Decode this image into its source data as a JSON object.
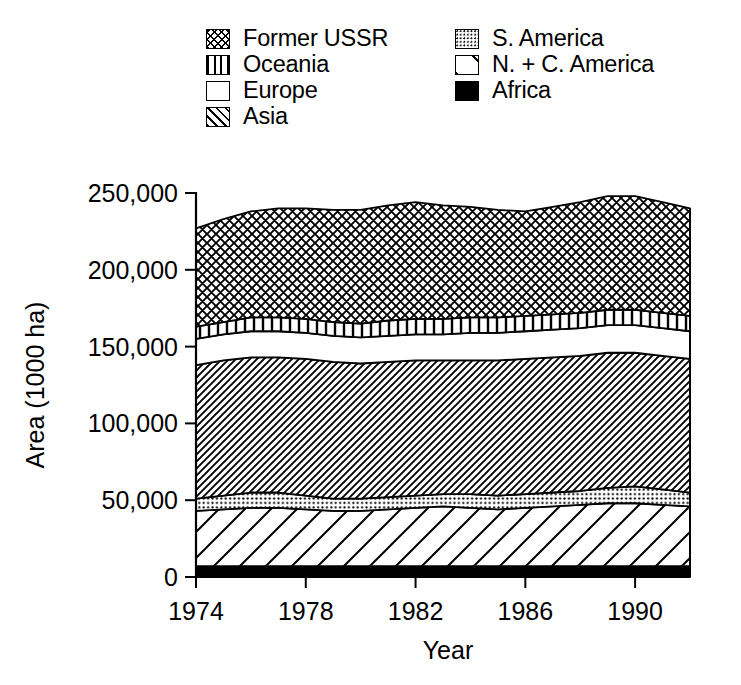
{
  "chart_data": {
    "type": "area",
    "stacked": true,
    "title": "",
    "xlabel": "Year",
    "ylabel": "Area (1000 ha)",
    "xlim": [
      1974,
      1992
    ],
    "ylim": [
      0,
      250000
    ],
    "ytick_labels": [
      "0",
      "50,000",
      "100,000",
      "150,000",
      "200,000",
      "250,000"
    ],
    "ytick_values": [
      0,
      50000,
      100000,
      150000,
      200000,
      250000
    ],
    "xtick_labels": [
      "1974",
      "1978",
      "1982",
      "1986",
      "1990"
    ],
    "xtick_values": [
      1974,
      1978,
      1982,
      1986,
      1990
    ],
    "grid": false,
    "legend_position": "above-plot",
    "x": [
      1974,
      1975,
      1976,
      1977,
      1978,
      1979,
      1980,
      1981,
      1982,
      1983,
      1984,
      1985,
      1986,
      1987,
      1988,
      1989,
      1990,
      1991,
      1992
    ],
    "stack_order_bottom_to_top": [
      "Africa",
      "N. + C. America",
      "S. America",
      "Asia",
      "Europe",
      "Oceania",
      "Former USSR"
    ],
    "series": [
      {
        "name": "Africa",
        "pattern": "solid-black",
        "values": [
          7000,
          7000,
          7000,
          7000,
          7000,
          7000,
          7000,
          7000,
          7000,
          7000,
          7000,
          7000,
          7000,
          7000,
          7000,
          7000,
          7000,
          7000,
          7000
        ]
      },
      {
        "name": "N. + C. America",
        "pattern": "diagonal-sparse",
        "values": [
          36000,
          37000,
          38000,
          38000,
          37000,
          36000,
          36000,
          37000,
          38000,
          39000,
          38000,
          37000,
          38000,
          39000,
          40000,
          41000,
          41000,
          40000,
          39000
        ]
      },
      {
        "name": "S. America",
        "pattern": "dots",
        "values": [
          8000,
          9000,
          10000,
          10000,
          9000,
          8000,
          8000,
          8000,
          8000,
          8000,
          9000,
          9000,
          9000,
          9000,
          9000,
          10000,
          11000,
          10000,
          9000
        ]
      },
      {
        "name": "Asia",
        "pattern": "diagonal-dense",
        "values": [
          87000,
          88000,
          88000,
          88000,
          89000,
          89000,
          88000,
          88000,
          88000,
          87000,
          87000,
          88000,
          88000,
          88000,
          88000,
          88000,
          87000,
          87000,
          87000
        ]
      },
      {
        "name": "Europe",
        "pattern": "white",
        "values": [
          17000,
          17000,
          17000,
          17000,
          17000,
          17000,
          17000,
          17000,
          17000,
          17000,
          18000,
          18000,
          18000,
          18000,
          18000,
          18000,
          18000,
          18000,
          18000
        ]
      },
      {
        "name": "Oceania",
        "pattern": "vertical-lines",
        "values": [
          8000,
          8000,
          9000,
          9000,
          9000,
          9000,
          9000,
          10000,
          10000,
          10000,
          10000,
          10000,
          10000,
          10000,
          10000,
          10000,
          10000,
          10000,
          10000
        ]
      },
      {
        "name": "Former USSR",
        "pattern": "cross-hatch",
        "values": [
          64000,
          67000,
          69000,
          71000,
          72000,
          73000,
          74000,
          75000,
          76000,
          74000,
          72000,
          70000,
          68000,
          70000,
          72000,
          74000,
          74000,
          72000,
          70000
        ]
      }
    ],
    "stack_tops": {
      "Africa": [
        7000,
        7000,
        7000,
        7000,
        7000,
        7000,
        7000,
        7000,
        7000,
        7000,
        7000,
        7000,
        7000,
        7000,
        7000,
        7000,
        7000,
        7000,
        7000
      ],
      "N. + C. America": [
        43000,
        44000,
        45000,
        45000,
        44000,
        43000,
        43000,
        44000,
        45000,
        46000,
        45000,
        44000,
        45000,
        46000,
        47000,
        48000,
        48000,
        47000,
        46000
      ],
      "S. America": [
        51000,
        53000,
        55000,
        55000,
        53000,
        51000,
        51000,
        52000,
        53000,
        54000,
        54000,
        53000,
        54000,
        55000,
        56000,
        58000,
        59000,
        57000,
        55000
      ],
      "Asia": [
        138000,
        141000,
        143000,
        143000,
        142000,
        140000,
        139000,
        140000,
        141000,
        141000,
        141000,
        141000,
        142000,
        143000,
        144000,
        146000,
        146000,
        144000,
        142000
      ],
      "Europe": [
        155000,
        158000,
        160000,
        160000,
        159000,
        157000,
        156000,
        157000,
        158000,
        158000,
        159000,
        159000,
        160000,
        161000,
        162000,
        164000,
        164000,
        162000,
        160000
      ],
      "Oceania": [
        163000,
        166000,
        169000,
        169000,
        168000,
        166000,
        165000,
        167000,
        168000,
        168000,
        169000,
        169000,
        170000,
        171000,
        172000,
        174000,
        174000,
        172000,
        170000
      ],
      "Former USSR": [
        227000,
        233000,
        238000,
        240000,
        240000,
        239000,
        239000,
        242000,
        244000,
        242000,
        241000,
        239000,
        238000,
        241000,
        244000,
        248000,
        248000,
        244000,
        240000
      ]
    },
    "legend_entries": [
      {
        "label": "Former USSR",
        "pattern": "cross-hatch",
        "column": "left",
        "row": 0
      },
      {
        "label": "Oceania",
        "pattern": "vertical-lines",
        "column": "left",
        "row": 1
      },
      {
        "label": "Europe",
        "pattern": "white",
        "column": "left",
        "row": 2
      },
      {
        "label": "Asia",
        "pattern": "diagonal-dense",
        "column": "left",
        "row": 3
      },
      {
        "label": "S. America",
        "pattern": "dots",
        "column": "right",
        "row": 0
      },
      {
        "label": "N. + C. America",
        "pattern": "diagonal-sparse",
        "column": "right",
        "row": 1
      },
      {
        "label": "Africa",
        "pattern": "solid-black",
        "column": "right",
        "row": 2
      }
    ],
    "colors": {
      "ink": "#000000",
      "background": "#ffffff"
    }
  }
}
